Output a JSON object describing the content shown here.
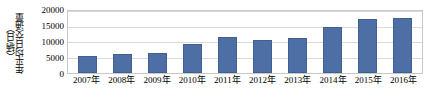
{
  "chart_data": {
    "type": "bar",
    "title": "",
    "xlabel": "",
    "ylabel": "年平均日交通量",
    "ylabel_unit": "（辆/日）",
    "categories": [
      "2007年",
      "2008年",
      "2009年",
      "2010年",
      "2011年",
      "2012年",
      "2013年",
      "2014年",
      "2015年",
      "2016年"
    ],
    "values": [
      5600,
      6100,
      6500,
      9200,
      11700,
      10600,
      11400,
      14900,
      17500,
      17600
    ],
    "ylim": [
      0,
      20000
    ],
    "yticks": [
      0,
      5000,
      10000,
      15000,
      20000
    ],
    "ytick_labels": [
      "0",
      "5000",
      "10000",
      "15000",
      "20000"
    ],
    "grid": true,
    "legend": "none",
    "series": [
      {
        "name": "年平均日交通量",
        "values": [
          5600,
          6100,
          6500,
          9200,
          11700,
          10600,
          11400,
          14900,
          17500,
          17600
        ]
      }
    ],
    "colors": {
      "bar": "#4e6fa6",
      "bar_border": "#42608f",
      "gridline": "#d9d9d9",
      "frame": "#c8c8c8",
      "text": "#000000",
      "background": "#ffffff"
    }
  }
}
